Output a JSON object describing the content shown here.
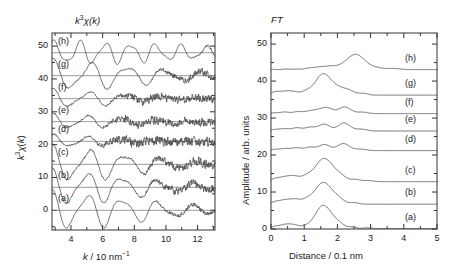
{
  "figure": {
    "panels": [
      {
        "id": "exafs",
        "title": "k3 chi(k)",
        "title_html": "k³χ(k)"
      },
      {
        "id": "ft",
        "title": "FT"
      }
    ]
  },
  "left_panel": {
    "title": "k³χ(k)",
    "ylabel": "k³χ(k)",
    "xlabel": "k / 10 nm⁻¹",
    "xlabel_main": "k",
    "xlabel_unit": "/ 10 nm",
    "xlabel_exp": "-1",
    "ytick_labels": [
      "0",
      "10",
      "20",
      "30",
      "40",
      "50"
    ],
    "xtick_labels": [
      "4",
      "6",
      "8",
      "10",
      "12"
    ],
    "curve_labels": [
      "(a)",
      "(b)",
      "(c)",
      "(d)",
      "(e)",
      "(f)",
      "(g)",
      "(h)"
    ]
  },
  "right_panel": {
    "title": "FT",
    "ylabel": "Amplitude / arb. units",
    "xlabel": "Distance / 0.1 nm",
    "ytick_labels": [
      "0",
      "10",
      "20",
      "30",
      "40",
      "50"
    ],
    "xtick_labels": [
      "0",
      "1",
      "2",
      "3",
      "4",
      "5"
    ],
    "curve_labels": [
      "(a)",
      "(b)",
      "(c)",
      "(d)",
      "(e)",
      "(f)",
      "(g)",
      "(h)"
    ]
  },
  "colors": {
    "curve": "#4a4a4a",
    "axis": "#333333",
    "baseline": "#6e6e6e",
    "text": "#1a1a1a",
    "background": "#ffffff"
  },
  "chart_data": {
    "type": "line",
    "panels": [
      {
        "name": "exafs",
        "title": "k³χ(k)",
        "xlabel": "k / 10 nm⁻¹",
        "ylabel": "k³χ(k)",
        "xlim": [
          2.8,
          13.1
        ],
        "ylim": [
          -6,
          54
        ],
        "xticks": [
          4,
          6,
          8,
          10,
          12
        ],
        "yticks": [
          0,
          10,
          20,
          30,
          40,
          50
        ],
        "grid": false,
        "legend": "inline-labels",
        "series": [
          {
            "name": "(a)",
            "offset": 0,
            "amplitude": 5.0,
            "period": 2.25,
            "phase": 0.55,
            "noise": 0.55,
            "noise_onset": 8.6,
            "damp": 0.055
          },
          {
            "name": "(b)",
            "offset": 7,
            "amplitude": 4.6,
            "period": 2.25,
            "phase": 0.55,
            "noise": 0.95,
            "noise_onset": 8.2,
            "damp": 0.065
          },
          {
            "name": "(c)",
            "offset": 14,
            "amplitude": 4.7,
            "period": 2.3,
            "phase": 0.5,
            "noise": 1.1,
            "noise_onset": 8.0,
            "damp": 0.07
          },
          {
            "name": "(d)",
            "offset": 21,
            "amplitude": 1.6,
            "period": 2.1,
            "phase": 0.4,
            "noise": 1.15,
            "noise_onset": 5.0,
            "damp": 0.12
          },
          {
            "name": "(e)",
            "offset": 27,
            "amplitude": 2.0,
            "period": 2.15,
            "phase": 0.45,
            "noise": 1.05,
            "noise_onset": 5.4,
            "damp": 0.11
          },
          {
            "name": "(f)",
            "offset": 34,
            "amplitude": 2.4,
            "period": 2.3,
            "phase": 0.5,
            "noise": 1.0,
            "noise_onset": 6.0,
            "damp": 0.1
          },
          {
            "name": "(g)",
            "offset": 41,
            "amplitude": 4.0,
            "period": 2.35,
            "phase": 0.45,
            "noise": 0.85,
            "noise_onset": 8.8,
            "damp": 0.05
          },
          {
            "name": "(h)",
            "offset": 48,
            "amplitude": 3.1,
            "period": 1.6,
            "phase": 0.3,
            "noise": 0.35,
            "noise_onset": 10.5,
            "damp": 0.02
          }
        ]
      },
      {
        "name": "ft",
        "title": "FT",
        "xlabel": "Distance / 0.1 nm",
        "ylabel": "Amplitude / arb. units",
        "xlim": [
          0,
          5
        ],
        "ylim": [
          0,
          53
        ],
        "xticks": [
          0,
          1,
          2,
          3,
          4,
          5
        ],
        "yticks": [
          0,
          10,
          20,
          30,
          40,
          50
        ],
        "grid": false,
        "legend": "inline-labels",
        "series": [
          {
            "name": "(a)",
            "baseline": 0,
            "peaks": [
              [
                0.25,
                0.9,
                0.2
              ],
              [
                0.62,
                1.2,
                0.18
              ],
              [
                1.0,
                0.5,
                0.15
              ],
              [
                1.58,
                6.4,
                0.25
              ],
              [
                2.05,
                1.1,
                0.16
              ],
              [
                2.45,
                0.5,
                0.14
              ],
              [
                2.9,
                0.3,
                0.15
              ]
            ]
          },
          {
            "name": "(b)",
            "baseline": 6.7,
            "peaks": [
              [
                0.28,
                1.0,
                0.2
              ],
              [
                0.68,
                1.3,
                0.18
              ],
              [
                1.05,
                0.9,
                0.16
              ],
              [
                1.58,
                5.9,
                0.26
              ],
              [
                2.05,
                1.0,
                0.16
              ],
              [
                2.5,
                0.4,
                0.15
              ]
            ]
          },
          {
            "name": "(c)",
            "baseline": 12.8,
            "peaks": [
              [
                0.25,
                1.1,
                0.2
              ],
              [
                0.65,
                1.5,
                0.18
              ],
              [
                1.05,
                1.1,
                0.16
              ],
              [
                1.6,
                6.3,
                0.27
              ],
              [
                2.1,
                1.2,
                0.17
              ],
              [
                2.55,
                0.6,
                0.15
              ],
              [
                2.95,
                0.3,
                0.14
              ]
            ]
          },
          {
            "name": "(d)",
            "baseline": 21.2,
            "peaks": [
              [
                0.3,
                0.5,
                0.2
              ],
              [
                0.75,
                0.7,
                0.18
              ],
              [
                1.2,
                0.9,
                0.17
              ],
              [
                1.62,
                1.6,
                0.16
              ],
              [
                2.18,
                1.9,
                0.18
              ],
              [
                2.7,
                0.4,
                0.16
              ]
            ]
          },
          {
            "name": "(e)",
            "baseline": 26.5,
            "peaks": [
              [
                0.3,
                0.6,
                0.2
              ],
              [
                0.78,
                0.8,
                0.18
              ],
              [
                1.22,
                1.0,
                0.17
              ],
              [
                1.62,
                1.8,
                0.16
              ],
              [
                2.2,
                2.2,
                0.18
              ],
              [
                2.72,
                0.5,
                0.16
              ]
            ]
          },
          {
            "name": "(f)",
            "baseline": 31.2,
            "peaks": [
              [
                0.35,
                0.4,
                0.2
              ],
              [
                0.85,
                0.5,
                0.18
              ],
              [
                1.3,
                0.9,
                0.18
              ],
              [
                1.68,
                1.6,
                0.17
              ],
              [
                2.22,
                1.8,
                0.18
              ],
              [
                2.75,
                0.4,
                0.16
              ]
            ]
          },
          {
            "name": "(g)",
            "baseline": 36.2,
            "peaks": [
              [
                0.2,
                1.0,
                0.18
              ],
              [
                0.6,
                1.1,
                0.17
              ],
              [
                1.05,
                0.9,
                0.16
              ],
              [
                1.58,
                5.8,
                0.24
              ],
              [
                2.05,
                1.5,
                0.17
              ],
              [
                2.35,
                1.2,
                0.15
              ],
              [
                2.75,
                0.5,
                0.15
              ]
            ]
          },
          {
            "name": "(h)",
            "baseline": 43.1,
            "peaks": [
              [
                0.55,
                0.15,
                0.2
              ],
              [
                1.25,
                0.4,
                0.22
              ],
              [
                1.75,
                0.9,
                0.28
              ],
              [
                2.55,
                4.1,
                0.28
              ],
              [
                3.2,
                0.4,
                0.2
              ],
              [
                3.7,
                0.3,
                0.18
              ]
            ]
          }
        ]
      }
    ]
  }
}
